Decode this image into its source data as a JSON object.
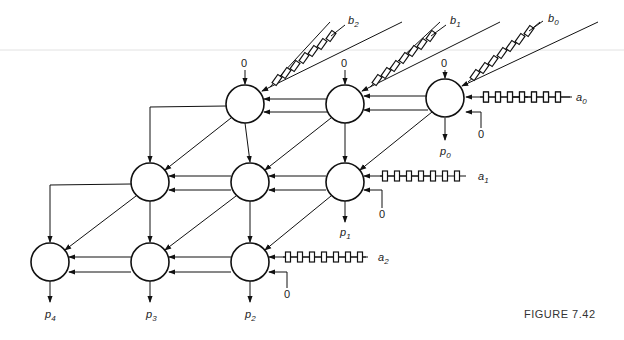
{
  "figure": {
    "caption": "FIGURE 7.42",
    "type": "systolic array multiplier"
  },
  "inputs": {
    "b": [
      {
        "label": "b",
        "sub": "2"
      },
      {
        "label": "b",
        "sub": "1"
      },
      {
        "label": "b",
        "sub": "0"
      }
    ],
    "a": [
      {
        "label": "a",
        "sub": "0"
      },
      {
        "label": "a",
        "sub": "1"
      },
      {
        "label": "a",
        "sub": "2"
      }
    ],
    "zero": "0"
  },
  "outputs": [
    {
      "label": "p",
      "sub": "0"
    },
    {
      "label": "p",
      "sub": "1"
    },
    {
      "label": "p",
      "sub": "2"
    },
    {
      "label": "p",
      "sub": "3"
    },
    {
      "label": "p",
      "sub": "4"
    }
  ],
  "delay_elements_per_line": 7,
  "grid": {
    "rows": 3,
    "cols": 3
  }
}
